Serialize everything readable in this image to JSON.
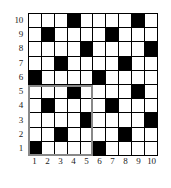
{
  "chart_data": {
    "type": "heatmap",
    "title": "",
    "subtitle": "",
    "xlabel": "",
    "ylabel": "",
    "grid": true,
    "legend": "none",
    "rows": 10,
    "cols": 10,
    "xlim": [
      1,
      10
    ],
    "ylim": [
      1,
      10
    ],
    "x_tick_labels": [
      "1",
      "2",
      "3",
      "4",
      "5",
      "6",
      "7",
      "8",
      "9",
      "10"
    ],
    "y_tick_labels": [
      "10",
      "9",
      "8",
      "7",
      "6",
      "5",
      "4",
      "3",
      "2",
      "1"
    ],
    "value_legend": {
      "0": "white / empty cell",
      "1": "black / filled cell"
    },
    "filled_cells": [
      {
        "row": 10,
        "cols": [
          4,
          9
        ]
      },
      {
        "row": 9,
        "cols": [
          2,
          7
        ]
      },
      {
        "row": 8,
        "cols": [
          5,
          10
        ]
      },
      {
        "row": 7,
        "cols": [
          3,
          8
        ]
      },
      {
        "row": 6,
        "cols": [
          1,
          6
        ]
      },
      {
        "row": 5,
        "cols": [
          4,
          9
        ]
      },
      {
        "row": 4,
        "cols": [
          2,
          7
        ]
      },
      {
        "row": 3,
        "cols": [
          5,
          10
        ]
      },
      {
        "row": 2,
        "cols": [
          3,
          8
        ]
      },
      {
        "row": 1,
        "cols": [
          1,
          6
        ]
      }
    ],
    "matrix_top_to_bottom": [
      [
        0,
        0,
        0,
        1,
        0,
        0,
        0,
        0,
        1,
        0
      ],
      [
        0,
        1,
        0,
        0,
        0,
        0,
        1,
        0,
        0,
        0
      ],
      [
        0,
        0,
        0,
        0,
        1,
        0,
        0,
        0,
        0,
        1
      ],
      [
        0,
        0,
        1,
        0,
        0,
        0,
        0,
        1,
        0,
        0
      ],
      [
        1,
        0,
        0,
        0,
        0,
        1,
        0,
        0,
        0,
        0
      ],
      [
        0,
        0,
        0,
        1,
        0,
        0,
        0,
        0,
        1,
        0
      ],
      [
        0,
        1,
        0,
        0,
        0,
        0,
        1,
        0,
        0,
        0
      ],
      [
        0,
        0,
        0,
        0,
        1,
        0,
        0,
        0,
        0,
        1
      ],
      [
        0,
        0,
        1,
        0,
        0,
        0,
        0,
        1,
        0,
        0
      ],
      [
        1,
        0,
        0,
        0,
        0,
        1,
        0,
        0,
        0,
        0
      ]
    ],
    "filled_count_per_row": [
      2,
      2,
      2,
      2,
      2,
      2,
      2,
      2,
      2,
      2
    ],
    "total_filled": 20,
    "highlight_region": {
      "label": "",
      "col_start": 1,
      "col_end": 5,
      "row_start": 1,
      "row_end": 5,
      "color": "#888888"
    }
  },
  "colors": {
    "filled": "#000000",
    "empty": "#ffffff",
    "gridline": "#000000",
    "highlight": "#888888",
    "text": "#1a1a1a"
  }
}
